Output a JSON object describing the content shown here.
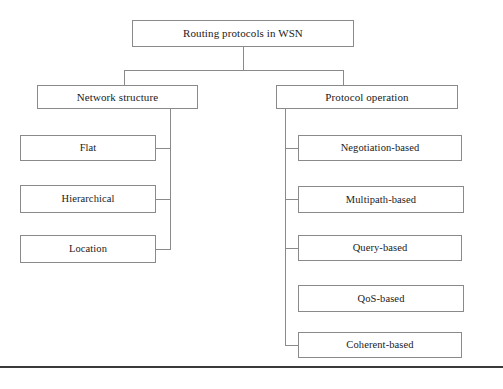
{
  "diagram": {
    "title": "Routing protocols in WSN",
    "type": "hierarchy-tree",
    "border_color": "#8a8a8a",
    "text_color": "#1a1a1a",
    "background_color": "#ffffff",
    "rule_color": "#3a3a3a"
  },
  "root": {
    "label": "Routing protocols in WSN"
  },
  "branches": [
    {
      "id": "network-structure",
      "label": "Network structure",
      "children": [
        {
          "id": "flat",
          "label": "Flat"
        },
        {
          "id": "hierarchical",
          "label": "Hierarchical"
        },
        {
          "id": "location",
          "label": "Location"
        }
      ]
    },
    {
      "id": "protocol-operation",
      "label": "Protocol operation",
      "children": [
        {
          "id": "negotiation-based",
          "label": "Negotiation-based"
        },
        {
          "id": "multipath-based",
          "label": "Multipath-based"
        },
        {
          "id": "query-based",
          "label": "Query-based"
        },
        {
          "id": "qos-based",
          "label": "QoS-based"
        },
        {
          "id": "coherent-based",
          "label": "Coherent-based"
        }
      ]
    }
  ]
}
